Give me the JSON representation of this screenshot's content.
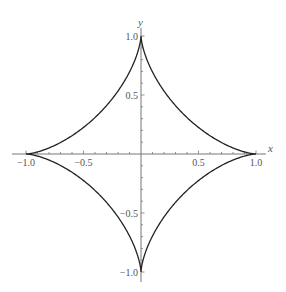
{
  "chart_data": {
    "type": "line",
    "title": "",
    "xlabel": "x",
    "ylabel": "y",
    "xlim": [
      -1.0,
      1.0
    ],
    "ylim": [
      -1.0,
      1.0
    ],
    "grid": false,
    "legend": "none",
    "x_ticks": [
      {
        "value": -1.0,
        "label": "−1.0"
      },
      {
        "value": -0.5,
        "label": "−0.5"
      },
      {
        "value": 0.5,
        "label": "0.5"
      },
      {
        "value": 1.0,
        "label": "1.0"
      }
    ],
    "y_ticks": [
      {
        "value": 1.0,
        "label": "1.0"
      },
      {
        "value": 0.5,
        "label": "0.5"
      },
      {
        "value": -0.5,
        "label": "−0.5"
      },
      {
        "value": -1.0,
        "label": "−1.0"
      }
    ],
    "minor_tick_step": 0.1,
    "series": [
      {
        "name": "astroid",
        "equation": "x^(2/3) + y^(2/3) = 1",
        "parametric": {
          "x": "cos(t)^3",
          "y": "sin(t)^3",
          "t_range": [
            0,
            6.283185
          ]
        },
        "color": "#222222"
      }
    ]
  }
}
